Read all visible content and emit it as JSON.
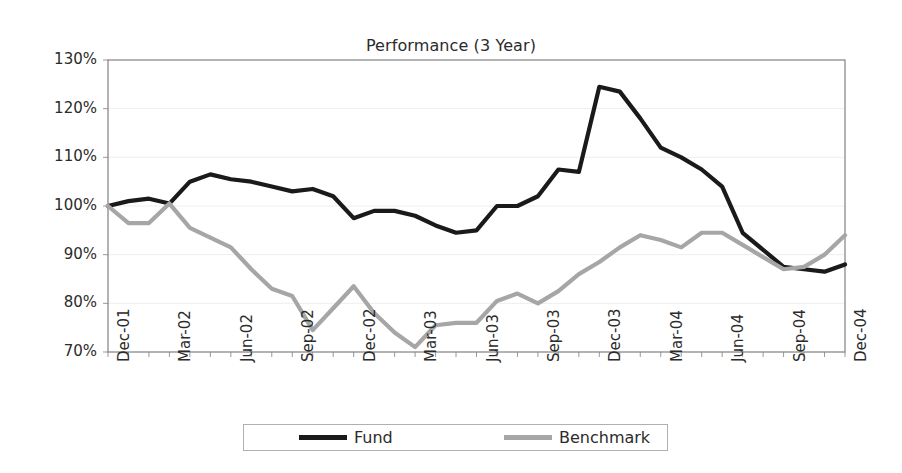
{
  "chart_data": {
    "type": "line",
    "title": "Performance (3 Year)",
    "xlabel": "",
    "ylabel": "",
    "ylim": [
      70,
      130
    ],
    "ytick_values": [
      70,
      80,
      90,
      100,
      110,
      120,
      130
    ],
    "ytick_labels": [
      "70%",
      "80%",
      "90%",
      "100%",
      "110%",
      "120%",
      "130%"
    ],
    "grid": true,
    "legend_position": "bottom",
    "x": [
      "Dec-01",
      "Jan-02",
      "Feb-02",
      "Mar-02",
      "Apr-02",
      "May-02",
      "Jun-02",
      "Jul-02",
      "Aug-02",
      "Sep-02",
      "Oct-02",
      "Nov-02",
      "Dec-02",
      "Jan-03",
      "Feb-03",
      "Mar-03",
      "Apr-03",
      "May-03",
      "Jun-03",
      "Jul-03",
      "Aug-03",
      "Sep-03",
      "Oct-03",
      "Nov-03",
      "Dec-03",
      "Jan-04",
      "Feb-04",
      "Mar-04",
      "Apr-04",
      "May-04",
      "Jun-04",
      "Jul-04",
      "Aug-04",
      "Sep-04",
      "Oct-04",
      "Nov-04",
      "Dec-04"
    ],
    "xtick_labels": [
      "Dec-01",
      "Mar-02",
      "Jun-02",
      "Sep-02",
      "Dec-02",
      "Mar-03",
      "Jun-03",
      "Sep-03",
      "Dec-03",
      "Mar-04",
      "Jun-04",
      "Sep-04",
      "Dec-04"
    ],
    "xtick_indices": [
      0,
      3,
      6,
      9,
      12,
      15,
      18,
      21,
      24,
      27,
      30,
      33,
      36
    ],
    "series": [
      {
        "name": "Fund",
        "color": "#1a1a1a",
        "values": [
          100.0,
          101.0,
          101.5,
          100.5,
          105.0,
          106.5,
          105.5,
          105.0,
          104.0,
          103.0,
          103.5,
          102.0,
          97.5,
          99.0,
          99.0,
          98.0,
          96.0,
          94.5,
          95.0,
          100.0,
          100.0,
          102.0,
          107.5,
          107.0,
          124.5,
          123.5,
          118.0,
          112.0,
          110.0,
          107.5,
          104.0,
          94.5,
          91.0,
          87.5,
          87.0,
          86.5,
          88.0
        ]
      },
      {
        "name": "Benchmark",
        "color": "#a6a6a6",
        "values": [
          100.0,
          96.5,
          96.5,
          100.5,
          95.5,
          93.5,
          91.5,
          87.0,
          83.0,
          81.5,
          74.5,
          79.0,
          83.5,
          78.0,
          74.0,
          71.0,
          75.5,
          76.0,
          76.0,
          80.5,
          82.0,
          80.0,
          82.5,
          86.0,
          88.5,
          91.5,
          94.0,
          93.0,
          91.5,
          94.5,
          94.5,
          92.0,
          89.5,
          87.0,
          87.5,
          90.0,
          94.0
        ]
      }
    ]
  },
  "legend": {
    "entries": [
      {
        "label": "Fund",
        "color": "#1a1a1a"
      },
      {
        "label": "Benchmark",
        "color": "#a6a6a6"
      }
    ]
  },
  "axes": {
    "plot_left": 108,
    "plot_right": 845,
    "plot_top": 60,
    "plot_bottom": 352,
    "border_color": "#808080",
    "grid_color": "#eeeeee"
  }
}
